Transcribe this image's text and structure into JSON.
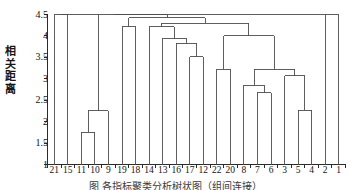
{
  "figure": {
    "title": "",
    "ylabel_chars": [
      "相",
      "关",
      "距",
      "离"
    ],
    "ylabel": "相关距离",
    "caption": "图 各指标聚类分析树状图（组间连接）",
    "line_color": "#4d4d4d",
    "axis_color": "#2b2b2b",
    "background": "#ffffff"
  },
  "chart_data": {
    "type": "dendrogram",
    "title": "",
    "xlabel": "",
    "ylabel": "相关距离",
    "ylim": [
      1,
      4.5
    ],
    "yticks": [
      1,
      1.5,
      2,
      2.5,
      3,
      3.5,
      4,
      4.5
    ],
    "ytick_labels": [
      "1",
      "1.5",
      "2",
      "2.5",
      "3",
      "3.5",
      "4",
      "4.5"
    ],
    "grid": false,
    "legend": null,
    "orientation": "vertical-top-down",
    "leaf_order": [
      21,
      15,
      11,
      10,
      9,
      19,
      18,
      14,
      13,
      16,
      17,
      12,
      22,
      20,
      8,
      7,
      6,
      3,
      5,
      4,
      2,
      1
    ],
    "leaf_labels": [
      "21",
      "15",
      "11",
      "10",
      "9",
      "19",
      "18",
      "14",
      "13",
      "16",
      "17",
      "12",
      "22",
      "20",
      "8",
      "7",
      "6",
      "3",
      "5",
      "4",
      "2",
      "1"
    ],
    "n_leaves": 22,
    "merges": [
      {
        "id": "m1",
        "left": "11",
        "right": "10",
        "height": 1.75
      },
      {
        "id": "m2",
        "left": "m1",
        "right": "9",
        "height": 2.25
      },
      {
        "id": "m3",
        "left": "5",
        "right": "4",
        "height": 2.27
      },
      {
        "id": "m4",
        "left": "7",
        "right": "6",
        "height": 2.68
      },
      {
        "id": "m5",
        "left": "8",
        "right": "m4",
        "height": 2.85
      },
      {
        "id": "m6",
        "left": "3",
        "right": "m3",
        "height": 3.07
      },
      {
        "id": "m7",
        "left": "m5",
        "right": "m6",
        "height": 3.22
      },
      {
        "id": "m8",
        "left": "22",
        "right": "20",
        "height": 3.22
      },
      {
        "id": "m9",
        "left": "17",
        "right": "12",
        "height": 3.52
      },
      {
        "id": "m10",
        "left": "16",
        "right": "m9",
        "height": 3.83
      },
      {
        "id": "m11",
        "left": "13",
        "right": "m10",
        "height": 3.95
      },
      {
        "id": "m12",
        "left": "m8",
        "right": "m7",
        "height": 4.0
      },
      {
        "id": "m13",
        "left": "14",
        "right": "m11",
        "height": 4.21
      },
      {
        "id": "m14",
        "left": "19",
        "right": "18",
        "height": 4.22
      },
      {
        "id": "m15",
        "left": "m13",
        "right": "m12",
        "height": 4.3
      },
      {
        "id": "m16",
        "left": "m14",
        "right": "m15",
        "height": 4.42
      },
      {
        "id": "m17",
        "left": "21",
        "right": "15",
        "height": 4.5
      },
      {
        "id": "m18",
        "left": "m17",
        "right": "m16",
        "height": 4.5
      },
      {
        "id": "m19",
        "left": "m18",
        "right": "1",
        "height": 4.5
      }
    ]
  }
}
